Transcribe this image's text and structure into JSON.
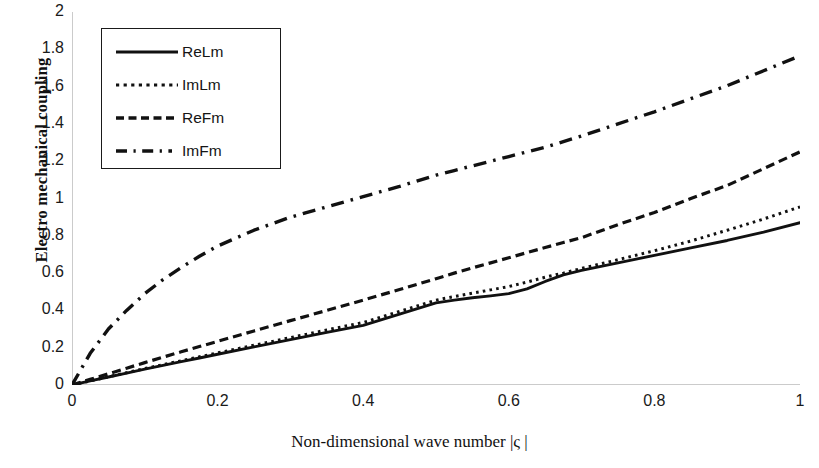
{
  "chart_data": {
    "type": "line",
    "title": "",
    "xlabel": "Non-dimensional wave number |ς |",
    "ylabel": "Electro mechanical coupling",
    "xlim": [
      0,
      1
    ],
    "ylim": [
      0,
      2
    ],
    "xticks": [
      "0",
      "0.2",
      "0.4",
      "0.6",
      "0.8",
      "1"
    ],
    "xtick_values": [
      0,
      0.2,
      0.4,
      0.6,
      0.8,
      1
    ],
    "yticks": [
      "0",
      "0.2",
      "0.4",
      "0.6",
      "0.8",
      "1",
      "1.2",
      "1.4",
      "1.6",
      "1.8",
      "2"
    ],
    "ytick_values": [
      0,
      0.2,
      0.4,
      0.6,
      0.8,
      1,
      1.2,
      1.4,
      1.6,
      1.8,
      2
    ],
    "grid": false,
    "legend_position": "upper left",
    "x": [
      0,
      0.025,
      0.05,
      0.075,
      0.1,
      0.125,
      0.15,
      0.175,
      0.2,
      0.25,
      0.3,
      0.35,
      0.4,
      0.45,
      0.5,
      0.525,
      0.55,
      0.575,
      0.6,
      0.625,
      0.65,
      0.675,
      0.7,
      0.75,
      0.8,
      0.85,
      0.9,
      0.95,
      1
    ],
    "series": [
      {
        "name": "ReLm",
        "style": "solid",
        "color": "#111111",
        "values": [
          0,
          0.022,
          0.043,
          0.064,
          0.085,
          0.105,
          0.125,
          0.145,
          0.165,
          0.204,
          0.243,
          0.282,
          0.32,
          0.38,
          0.44,
          0.455,
          0.468,
          0.478,
          0.49,
          0.515,
          0.555,
          0.59,
          0.615,
          0.655,
          0.695,
          0.735,
          0.775,
          0.82,
          0.87
        ]
      },
      {
        "name": "ImLm",
        "style": "dotted",
        "color": "#111111",
        "values": [
          0,
          0.022,
          0.044,
          0.066,
          0.088,
          0.109,
          0.13,
          0.151,
          0.172,
          0.213,
          0.254,
          0.295,
          0.335,
          0.395,
          0.455,
          0.474,
          0.492,
          0.51,
          0.528,
          0.552,
          0.578,
          0.6,
          0.625,
          0.672,
          0.72,
          0.772,
          0.83,
          0.89,
          0.955
        ]
      },
      {
        "name": "ReFm",
        "style": "dashed",
        "color": "#111111",
        "values": [
          0,
          0.03,
          0.06,
          0.09,
          0.12,
          0.149,
          0.178,
          0.206,
          0.234,
          0.29,
          0.345,
          0.4,
          0.455,
          0.512,
          0.57,
          0.6,
          0.628,
          0.655,
          0.682,
          0.71,
          0.737,
          0.764,
          0.79,
          0.86,
          0.925,
          1.0,
          1.07,
          1.16,
          1.25
        ]
      },
      {
        "name": "ImFm",
        "style": "dashdot",
        "color": "#111111",
        "values": [
          0,
          0.17,
          0.3,
          0.4,
          0.49,
          0.565,
          0.63,
          0.69,
          0.745,
          0.83,
          0.9,
          0.955,
          1.01,
          1.065,
          1.125,
          1.15,
          1.175,
          1.2,
          1.225,
          1.25,
          1.275,
          1.305,
          1.335,
          1.4,
          1.465,
          1.535,
          1.605,
          1.685,
          1.765
        ]
      }
    ]
  },
  "legend": {
    "items": [
      {
        "label": "ReLm",
        "style": "solid"
      },
      {
        "label": "ImLm",
        "style": "dotted"
      },
      {
        "label": "ReFm",
        "style": "dashed"
      },
      {
        "label": "ImFm",
        "style": "dashdot"
      }
    ]
  }
}
